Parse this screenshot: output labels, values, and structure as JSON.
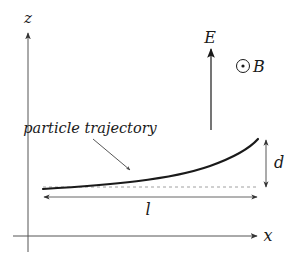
{
  "diagram": {
    "type": "physics-schematic",
    "axes": {
      "vertical_label": "z",
      "horizontal_label": "x"
    },
    "fields": {
      "electric_label": "E",
      "electric_direction": "up",
      "magnetic_symbol": "⊙",
      "magnetic_label": "B",
      "magnetic_direction": "out-of-page"
    },
    "trajectory": {
      "label": "particle trajectory"
    },
    "dimensions": {
      "horizontal_length_label": "l",
      "vertical_displacement_label": "d"
    },
    "colors": {
      "ink": "#1a1a1a",
      "axis": "#555555",
      "dashed": "#888888",
      "background": "#ffffff"
    }
  }
}
